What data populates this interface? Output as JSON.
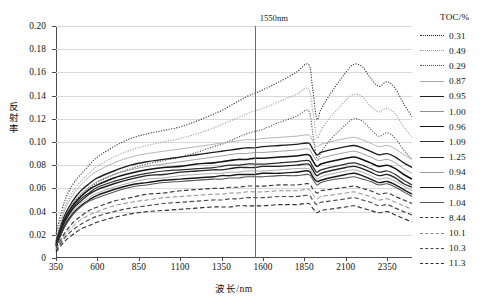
{
  "chart": {
    "type": "line",
    "y_axis_title": "反射率",
    "x_axis_title": "波长/nm",
    "marker_label": "1550nm",
    "legend_title": "TOC/%"
  },
  "chart_data": {
    "type": "line",
    "title": "",
    "xlabel": "波长/nm",
    "ylabel": "反射率",
    "xlim": [
      350,
      2500
    ],
    "ylim": [
      0,
      0.2
    ],
    "xticks": [
      350,
      600,
      850,
      1100,
      1350,
      1600,
      1850,
      2100,
      2350
    ],
    "yticks": [
      0,
      0.02,
      0.04,
      0.06,
      0.08,
      0.1,
      0.12,
      0.14,
      0.16,
      0.18,
      0.2
    ],
    "grid": "horizontal",
    "legend_position": "right",
    "legend_title": "TOC/%",
    "annotations": [
      {
        "type": "vline",
        "x": 1550,
        "label": "1550nm"
      }
    ],
    "x": [
      350,
      400,
      450,
      500,
      550,
      600,
      700,
      800,
      900,
      1000,
      1100,
      1200,
      1300,
      1350,
      1400,
      1450,
      1500,
      1550,
      1600,
      1700,
      1800,
      1875,
      1900,
      1925,
      1950,
      2000,
      2100,
      2150,
      2200,
      2250,
      2300,
      2350,
      2400,
      2450,
      2500
    ],
    "series": [
      {
        "name": "0.31",
        "style": "dotted",
        "width": 1.1,
        "color": "#2b2b2b",
        "values": [
          0.021,
          0.048,
          0.063,
          0.072,
          0.08,
          0.087,
          0.096,
          0.103,
          0.107,
          0.11,
          0.113,
          0.118,
          0.124,
          0.127,
          0.131,
          0.135,
          0.139,
          0.142,
          0.145,
          0.152,
          0.16,
          0.167,
          0.146,
          0.12,
          0.128,
          0.14,
          0.16,
          0.167,
          0.165,
          0.155,
          0.148,
          0.152,
          0.146,
          0.133,
          0.122
        ]
      },
      {
        "name": "0.49",
        "style": "dotted",
        "width": 1.1,
        "color": "#9a9a9a",
        "values": [
          0.019,
          0.043,
          0.057,
          0.066,
          0.073,
          0.079,
          0.087,
          0.093,
          0.097,
          0.1,
          0.103,
          0.107,
          0.112,
          0.115,
          0.118,
          0.121,
          0.124,
          0.127,
          0.129,
          0.135,
          0.141,
          0.146,
          0.127,
          0.104,
          0.11,
          0.12,
          0.136,
          0.141,
          0.139,
          0.131,
          0.126,
          0.129,
          0.124,
          0.113,
          0.104
        ]
      },
      {
        "name": "0.29",
        "style": "dotted",
        "width": 1.1,
        "color": "#4d4d4d",
        "values": [
          0.014,
          0.034,
          0.046,
          0.054,
          0.06,
          0.065,
          0.072,
          0.077,
          0.081,
          0.084,
          0.087,
          0.091,
          0.096,
          0.098,
          0.101,
          0.104,
          0.107,
          0.109,
          0.111,
          0.117,
          0.122,
          0.127,
          0.108,
          0.086,
          0.091,
          0.101,
          0.115,
          0.12,
          0.118,
          0.111,
          0.105,
          0.108,
          0.103,
          0.093,
          0.085
        ]
      },
      {
        "name": "0.87",
        "style": "solid",
        "width": 0.85,
        "color": "#a8a8a8",
        "values": [
          0.016,
          0.04,
          0.054,
          0.063,
          0.07,
          0.075,
          0.082,
          0.087,
          0.09,
          0.092,
          0.094,
          0.096,
          0.098,
          0.099,
          0.1,
          0.101,
          0.102,
          0.102,
          0.103,
          0.104,
          0.105,
          0.106,
          0.101,
          0.096,
          0.098,
          0.1,
          0.103,
          0.104,
          0.102,
          0.099,
          0.096,
          0.097,
          0.094,
          0.089,
          0.085
        ]
      },
      {
        "name": "0.95",
        "style": "solid",
        "width": 1.35,
        "color": "#1f1f1f",
        "values": [
          0.014,
          0.036,
          0.049,
          0.058,
          0.064,
          0.069,
          0.075,
          0.08,
          0.083,
          0.085,
          0.087,
          0.089,
          0.091,
          0.092,
          0.093,
          0.094,
          0.095,
          0.095,
          0.096,
          0.097,
          0.098,
          0.099,
          0.094,
          0.089,
          0.091,
          0.093,
          0.096,
          0.097,
          0.095,
          0.092,
          0.089,
          0.09,
          0.087,
          0.082,
          0.078
        ]
      },
      {
        "name": "1.00",
        "style": "solid",
        "width": 0.85,
        "color": "#8f8f8f",
        "values": [
          0.013,
          0.034,
          0.047,
          0.055,
          0.061,
          0.066,
          0.072,
          0.076,
          0.079,
          0.081,
          0.083,
          0.085,
          0.087,
          0.088,
          0.089,
          0.09,
          0.09,
          0.091,
          0.091,
          0.092,
          0.093,
          0.094,
          0.089,
          0.084,
          0.086,
          0.088,
          0.091,
          0.092,
          0.09,
          0.087,
          0.084,
          0.085,
          0.082,
          0.077,
          0.073
        ]
      },
      {
        "name": "0.96",
        "style": "solid",
        "width": 1.55,
        "color": "#141414",
        "values": [
          0.012,
          0.033,
          0.045,
          0.053,
          0.059,
          0.063,
          0.069,
          0.073,
          0.076,
          0.078,
          0.079,
          0.081,
          0.082,
          0.083,
          0.084,
          0.085,
          0.085,
          0.086,
          0.086,
          0.087,
          0.088,
          0.089,
          0.084,
          0.079,
          0.081,
          0.083,
          0.086,
          0.087,
          0.085,
          0.082,
          0.079,
          0.08,
          0.077,
          0.072,
          0.068
        ]
      },
      {
        "name": "1.09",
        "style": "solid",
        "width": 1.25,
        "color": "#2e2e2e",
        "values": [
          0.011,
          0.031,
          0.043,
          0.051,
          0.056,
          0.061,
          0.066,
          0.07,
          0.073,
          0.075,
          0.076,
          0.077,
          0.078,
          0.079,
          0.08,
          0.08,
          0.081,
          0.081,
          0.081,
          0.082,
          0.083,
          0.084,
          0.079,
          0.074,
          0.076,
          0.078,
          0.081,
          0.082,
          0.08,
          0.077,
          0.074,
          0.075,
          0.072,
          0.067,
          0.063
        ]
      },
      {
        "name": "1.25",
        "style": "solid",
        "width": 1.35,
        "color": "#242424",
        "values": [
          0.011,
          0.03,
          0.042,
          0.049,
          0.055,
          0.059,
          0.064,
          0.068,
          0.071,
          0.072,
          0.074,
          0.075,
          0.076,
          0.076,
          0.077,
          0.078,
          0.078,
          0.078,
          0.079,
          0.079,
          0.08,
          0.081,
          0.076,
          0.071,
          0.073,
          0.075,
          0.078,
          0.079,
          0.077,
          0.074,
          0.071,
          0.072,
          0.069,
          0.064,
          0.061
        ]
      },
      {
        "name": "0.94",
        "style": "solid",
        "width": 0.85,
        "color": "#9c9c9c",
        "values": [
          0.01,
          0.028,
          0.04,
          0.047,
          0.052,
          0.056,
          0.061,
          0.065,
          0.068,
          0.069,
          0.071,
          0.072,
          0.073,
          0.073,
          0.074,
          0.074,
          0.075,
          0.075,
          0.075,
          0.076,
          0.077,
          0.077,
          0.073,
          0.068,
          0.07,
          0.072,
          0.075,
          0.076,
          0.074,
          0.071,
          0.068,
          0.069,
          0.066,
          0.062,
          0.058
        ]
      },
      {
        "name": "0.84",
        "style": "solid",
        "width": 1.45,
        "color": "#1a1a1a",
        "values": [
          0.01,
          0.027,
          0.038,
          0.045,
          0.05,
          0.054,
          0.059,
          0.063,
          0.065,
          0.067,
          0.068,
          0.069,
          0.07,
          0.071,
          0.071,
          0.072,
          0.072,
          0.072,
          0.073,
          0.073,
          0.074,
          0.075,
          0.07,
          0.066,
          0.067,
          0.069,
          0.072,
          0.073,
          0.071,
          0.068,
          0.065,
          0.066,
          0.063,
          0.059,
          0.055
        ]
      },
      {
        "name": "1.04",
        "style": "solid",
        "width": 1.05,
        "color": "#555555",
        "values": [
          0.009,
          0.026,
          0.037,
          0.044,
          0.049,
          0.052,
          0.057,
          0.061,
          0.063,
          0.065,
          0.066,
          0.067,
          0.068,
          0.068,
          0.069,
          0.069,
          0.07,
          0.07,
          0.07,
          0.071,
          0.071,
          0.072,
          0.068,
          0.063,
          0.065,
          0.067,
          0.069,
          0.07,
          0.068,
          0.066,
          0.063,
          0.064,
          0.061,
          0.057,
          0.053
        ]
      },
      {
        "name": "8.44",
        "style": "dashed",
        "width": 1.15,
        "color": "#3a3a3a",
        "values": [
          0.008,
          0.021,
          0.03,
          0.036,
          0.041,
          0.044,
          0.049,
          0.052,
          0.055,
          0.056,
          0.058,
          0.059,
          0.06,
          0.06,
          0.061,
          0.061,
          0.062,
          0.062,
          0.062,
          0.063,
          0.063,
          0.064,
          0.06,
          0.056,
          0.058,
          0.059,
          0.061,
          0.062,
          0.06,
          0.058,
          0.055,
          0.056,
          0.053,
          0.05,
          0.047
        ]
      },
      {
        "name": "10.1",
        "style": "dashed",
        "width": 1.0,
        "color": "#8a8a8a",
        "values": [
          0.007,
          0.019,
          0.027,
          0.033,
          0.037,
          0.04,
          0.045,
          0.048,
          0.05,
          0.052,
          0.053,
          0.054,
          0.055,
          0.055,
          0.056,
          0.056,
          0.057,
          0.057,
          0.057,
          0.058,
          0.058,
          0.059,
          0.055,
          0.051,
          0.053,
          0.054,
          0.056,
          0.057,
          0.055,
          0.053,
          0.05,
          0.051,
          0.048,
          0.045,
          0.042
        ]
      },
      {
        "name": "10.3",
        "style": "dashed",
        "width": 1.15,
        "color": "#4a4a4a",
        "values": [
          0.006,
          0.017,
          0.024,
          0.029,
          0.033,
          0.036,
          0.04,
          0.043,
          0.045,
          0.047,
          0.048,
          0.049,
          0.05,
          0.05,
          0.051,
          0.051,
          0.052,
          0.052,
          0.052,
          0.053,
          0.053,
          0.054,
          0.05,
          0.046,
          0.048,
          0.049,
          0.051,
          0.052,
          0.05,
          0.048,
          0.045,
          0.046,
          0.043,
          0.04,
          0.037
        ]
      },
      {
        "name": "11.3",
        "style": "dashed",
        "width": 1.15,
        "color": "#2f2f2f",
        "values": [
          0.005,
          0.014,
          0.02,
          0.025,
          0.028,
          0.031,
          0.035,
          0.038,
          0.04,
          0.041,
          0.042,
          0.043,
          0.044,
          0.044,
          0.044,
          0.045,
          0.045,
          0.045,
          0.045,
          0.046,
          0.046,
          0.047,
          0.043,
          0.039,
          0.041,
          0.042,
          0.044,
          0.045,
          0.043,
          0.041,
          0.039,
          0.04,
          0.037,
          0.034,
          0.031
        ]
      }
    ]
  }
}
